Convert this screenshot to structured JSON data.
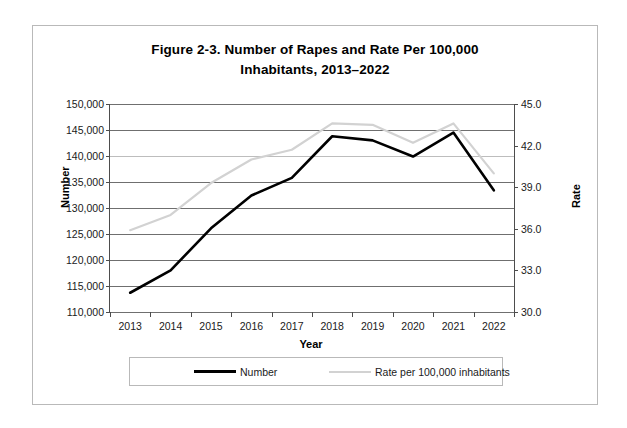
{
  "figure": {
    "title_line_1": "Figure 2-3. Number of Rapes and Rate Per 100,000",
    "title_line_2": "Inhabitants, 2013–2022"
  },
  "axes": {
    "y_left_title": "Number",
    "y_right_title": "Rate",
    "x_title": "Year",
    "y_left_ticks": [
      "150,000",
      "145,000",
      "140,000",
      "135,000",
      "130,000",
      "125,000",
      "120,000",
      "115,000",
      "110,000"
    ],
    "y_right_ticks": [
      "45.0",
      "42.0",
      "39.0",
      "36.0",
      "33.0",
      "30.0"
    ]
  },
  "legend": {
    "number_label": "Number",
    "rate_label": "Rate per 100,000 inhabitants"
  },
  "colors": {
    "number_series": "#000000",
    "rate_series": "#d2d2d2",
    "gridline": "#6f6f6f",
    "axis": "#4d4d4d",
    "frame": "#b9b9b9",
    "text": "#1a1a1a"
  },
  "chart_data": {
    "type": "line",
    "title": "Figure 2-3. Number of Rapes and Rate Per 100,000 Inhabitants, 2013–2022",
    "xlabel": "Year",
    "ylabel": "Number",
    "y2label": "Rate",
    "categories": [
      "2013",
      "2014",
      "2015",
      "2016",
      "2017",
      "2018",
      "2019",
      "2020",
      "2021",
      "2022"
    ],
    "grid": true,
    "legend_position": "bottom",
    "ylim": [
      110000,
      150000
    ],
    "ytick_step": 5000,
    "y2lim": [
      30.0,
      45.0
    ],
    "y2tick_step": 3.0,
    "series": [
      {
        "name": "Number",
        "axis": "left",
        "color": "#000000",
        "values": [
          113700,
          118000,
          126100,
          132400,
          135800,
          143800,
          143000,
          139900,
          144500,
          133400
        ]
      },
      {
        "name": "Rate per 100,000 inhabitants",
        "axis": "right",
        "color": "#d2d2d2",
        "values": [
          35.9,
          37.0,
          39.3,
          41.0,
          41.7,
          43.6,
          43.5,
          42.2,
          43.6,
          40.0
        ]
      }
    ]
  }
}
